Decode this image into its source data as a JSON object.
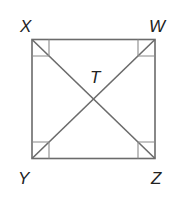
{
  "diagram": {
    "type": "rectangle with diagonals",
    "vertices": [
      {
        "label": "X",
        "position": "top-left"
      },
      {
        "label": "W",
        "position": "top-right"
      },
      {
        "label": "Y",
        "position": "bottom-left"
      },
      {
        "label": "Z",
        "position": "bottom-right"
      }
    ],
    "intersection": {
      "label": "T"
    },
    "diagonals": [
      "XZ",
      "WY"
    ],
    "right_angle_marks": [
      "X",
      "W",
      "Y",
      "Z"
    ],
    "colors": {
      "line": "#6b6b6b",
      "text": "#222222",
      "background": "#ffffff"
    }
  }
}
